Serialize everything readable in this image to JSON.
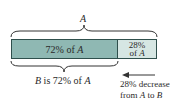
{
  "diagram": {
    "top_brace_label": "A",
    "segments": [
      {
        "label_prefix": "72% of ",
        "label_var": "A",
        "percent": 72,
        "color": "#8fb8b3"
      },
      {
        "line1": "28%",
        "line2_prefix": "of ",
        "line2_var": "A",
        "percent": 28,
        "color": "#d6e6e3"
      }
    ],
    "bottom_brace_label": {
      "var1": "B",
      "middle": " is 72% of ",
      "var2": "A"
    },
    "arrow_annotation": {
      "line1": "28% decrease",
      "line2_prefix": "from ",
      "var1": "A",
      "middle": " to ",
      "var2": "B"
    }
  }
}
